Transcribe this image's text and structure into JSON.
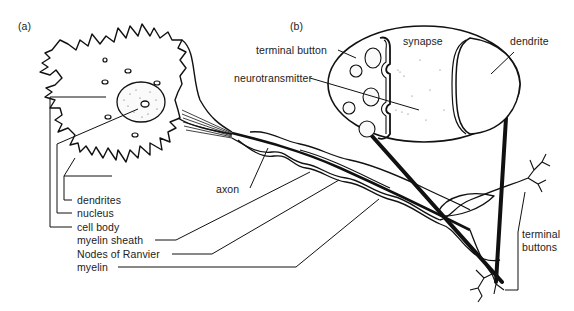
{
  "panels": {
    "a": "(a)",
    "b": "(b)"
  },
  "labels_a": {
    "dendrites": "dendrites",
    "nucleus": "nucleus",
    "cell_body": "cell body",
    "myelin_sheath": "myelin sheath",
    "nodes_of_ranvier": "Nodes of Ranvier",
    "myelin": "myelin",
    "axon": "axon"
  },
  "labels_b": {
    "terminal_button": "terminal button",
    "neurotransmitter": "neurotransmitter",
    "synapse": "synapse",
    "dendrite": "dendrite"
  },
  "labels_terminal": {
    "line1": "terminal",
    "line2": "buttons"
  }
}
